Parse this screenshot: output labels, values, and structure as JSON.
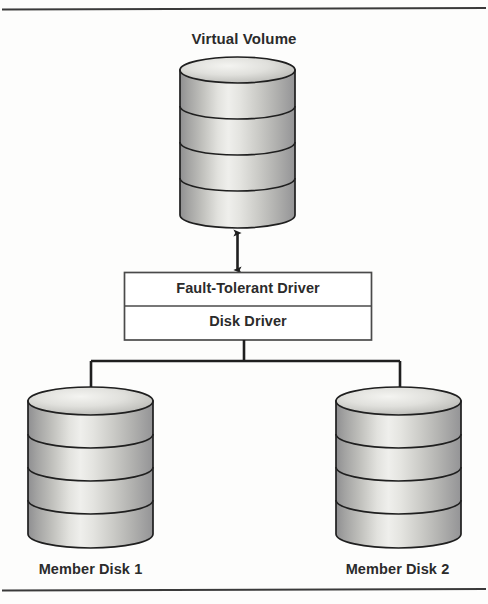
{
  "figure": {
    "kind": "block-diagram",
    "background_color": "#fdfdfc",
    "ink_color": "#2b2b2b",
    "title": "Virtual Volume"
  },
  "rules": {
    "top_rule_label": "top-rule",
    "bottom_rule_label": "bottom-rule"
  },
  "nodes": {
    "virtual_volume": {
      "label": "Virtual Volume",
      "shape": "cylinder",
      "platters": 4
    },
    "driver_stack": {
      "rows": [
        {
          "label": "Fault-Tolerant Driver"
        },
        {
          "label": "Disk Driver"
        }
      ]
    },
    "member_disk_1": {
      "label": "Member Disk 1",
      "shape": "cylinder",
      "platters": 4
    },
    "member_disk_2": {
      "label": "Member Disk 2",
      "shape": "cylinder",
      "platters": 4
    }
  },
  "connectors": [
    {
      "name": "virtual-volume-to-driver",
      "from": "virtual_volume",
      "to": "driver_stack",
      "arrowheads": "both"
    },
    {
      "name": "driver-to-member-disk-1",
      "from": "driver_stack",
      "to": "member_disk_1",
      "arrowheads": "end"
    },
    {
      "name": "driver-to-member-disk-2",
      "from": "driver_stack",
      "to": "member_disk_2",
      "arrowheads": "end"
    }
  ],
  "colors": {
    "ink": "#2b2b2b",
    "rule": "#3a3a3a",
    "cylinder_edge": "#1f1f1f",
    "cylinder_light": "#ededea",
    "cylinder_mid": "#c9c9c4",
    "cylinder_dark": "#98989a",
    "box_stroke": "#4a4a4a",
    "box_fill": "#ffffff"
  }
}
